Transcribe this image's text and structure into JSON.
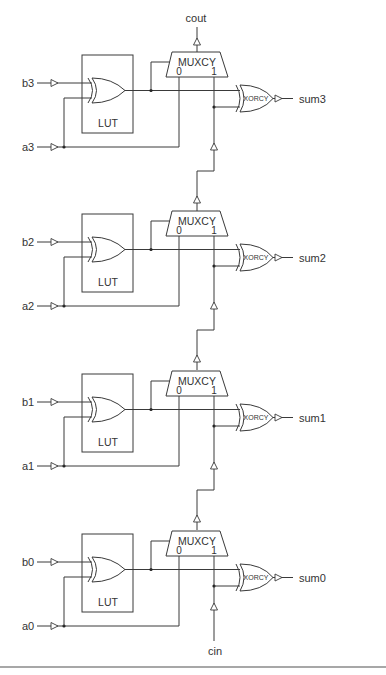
{
  "diagram": {
    "title": "",
    "colors": {
      "line": "#3a3a3a",
      "text": "#333333",
      "background": "#ffffff",
      "rule": "#8a8a8a"
    },
    "top_output_label": "cout",
    "bottom_input_label": "cin",
    "stages": [
      {
        "index": 3,
        "b_label": "b3",
        "a_label": "a3",
        "lut_label": "LUT",
        "mux_label": "MUXCY",
        "mux_in0": "0",
        "mux_in1": "1",
        "xorcy_label": "XORCY",
        "sum_label": "sum3"
      },
      {
        "index": 2,
        "b_label": "b2",
        "a_label": "a2",
        "lut_label": "LUT",
        "mux_label": "MUXCY",
        "mux_in0": "0",
        "mux_in1": "1",
        "xorcy_label": "XORCY",
        "sum_label": "sum2"
      },
      {
        "index": 1,
        "b_label": "b1",
        "a_label": "a1",
        "lut_label": "LUT",
        "mux_label": "MUXCY",
        "mux_in0": "0",
        "mux_in1": "1",
        "xorcy_label": "XORCY",
        "sum_label": "sum1"
      },
      {
        "index": 0,
        "b_label": "b0",
        "a_label": "a0",
        "lut_label": "LUT",
        "mux_label": "MUXCY",
        "mux_in0": "0",
        "mux_in1": "1",
        "xorcy_label": "XORCY",
        "sum_label": "sum0"
      }
    ]
  }
}
